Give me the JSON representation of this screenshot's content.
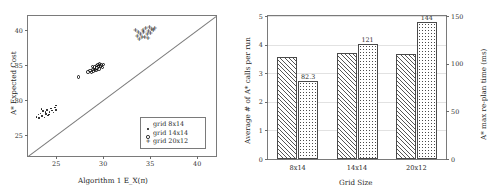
{
  "figure": {
    "panels": [
      "scatter",
      "grouped-bar"
    ]
  },
  "chart_data": [
    {
      "type": "scatter",
      "title": "",
      "xlabel": "Algorithm 1 E_X(π)",
      "ylabel": "A* Expected Cost",
      "xlim": [
        22,
        42
      ],
      "ylim": [
        22,
        42
      ],
      "xticks": [
        25,
        30,
        35,
        40
      ],
      "yticks": [
        25,
        30,
        35,
        40
      ],
      "grid": false,
      "legend_position": "lower-right",
      "reference_line": {
        "type": "identity",
        "label": "y = x"
      },
      "series": [
        {
          "name": "grid 8x14",
          "marker": "dot",
          "points": [
            [
              22.9,
              27.6
            ],
            [
              23.1,
              27.9
            ],
            [
              23.2,
              27.4
            ],
            [
              23.35,
              28.1
            ],
            [
              23.5,
              27.7
            ],
            [
              23.6,
              28.4
            ],
            [
              23.75,
              27.5
            ],
            [
              23.9,
              28.0
            ],
            [
              24.0,
              28.6
            ],
            [
              24.15,
              27.8
            ],
            [
              24.3,
              28.3
            ],
            [
              24.45,
              28.8
            ],
            [
              24.55,
              28.5
            ],
            [
              24.7,
              28.2
            ],
            [
              24.85,
              28.9
            ],
            [
              25.0,
              29.2
            ],
            [
              24.95,
              28.6
            ],
            [
              23.45,
              28.7
            ],
            [
              24.25,
              27.9
            ],
            [
              23.85,
              28.25
            ]
          ]
        },
        {
          "name": "grid 14x14",
          "marker": "circle",
          "points": [
            [
              27.4,
              33.3
            ],
            [
              28.4,
              34.0
            ],
            [
              28.6,
              34.25
            ],
            [
              28.75,
              33.95
            ],
            [
              28.9,
              34.4
            ],
            [
              29.0,
              34.15
            ],
            [
              29.1,
              34.7
            ],
            [
              29.2,
              34.35
            ],
            [
              29.3,
              34.9
            ],
            [
              29.35,
              34.55
            ],
            [
              29.45,
              35.05
            ],
            [
              29.5,
              34.75
            ],
            [
              29.6,
              35.15
            ],
            [
              29.7,
              34.85
            ],
            [
              29.8,
              35.0
            ],
            [
              29.9,
              34.6
            ],
            [
              30.0,
              35.1
            ],
            [
              29.25,
              34.2
            ],
            [
              29.55,
              34.45
            ],
            [
              28.85,
              34.8
            ]
          ]
        },
        {
          "name": "grid 20x12",
          "marker": "plus",
          "points": [
            [
              33.4,
              39.9
            ],
            [
              33.6,
              39.1
            ],
            [
              33.8,
              38.7
            ],
            [
              33.95,
              39.4
            ],
            [
              34.1,
              39.0
            ],
            [
              34.25,
              39.7
            ],
            [
              34.4,
              38.9
            ],
            [
              34.5,
              40.2
            ],
            [
              34.65,
              39.3
            ],
            [
              34.8,
              39.8
            ],
            [
              34.9,
              40.3
            ],
            [
              35.0,
              39.5
            ],
            [
              35.15,
              40.1
            ],
            [
              35.3,
              39.9
            ],
            [
              35.45,
              40.2
            ],
            [
              34.2,
              40.0
            ],
            [
              33.7,
              39.6
            ],
            [
              34.75,
              38.8
            ]
          ]
        }
      ]
    },
    {
      "type": "bar",
      "title": "",
      "xlabel": "Grid Size",
      "ylabel": "Average # of A* calls per run",
      "ylabel_right": "A* max re-plan time (ms)",
      "categories": [
        "8x14",
        "14x14",
        "20x12"
      ],
      "ylim": [
        0,
        5
      ],
      "yticks": [
        0,
        1,
        2,
        3,
        4,
        5
      ],
      "ylim_right": [
        0,
        150
      ],
      "yticks_right": [
        0,
        50,
        100,
        150
      ],
      "grid": true,
      "legend_position": "none",
      "series": [
        {
          "name": "Average # of A* calls per run",
          "axis": "left",
          "pattern": "diagonal-hatch",
          "values": [
            3.57,
            3.69,
            3.66
          ],
          "labels": [
            "",
            "",
            ""
          ]
        },
        {
          "name": "A* max re-plan time (ms)",
          "axis": "right",
          "pattern": "dots",
          "values": [
            82.3,
            121,
            144
          ],
          "labels": [
            "82.3",
            "121",
            "144"
          ]
        }
      ]
    }
  ]
}
